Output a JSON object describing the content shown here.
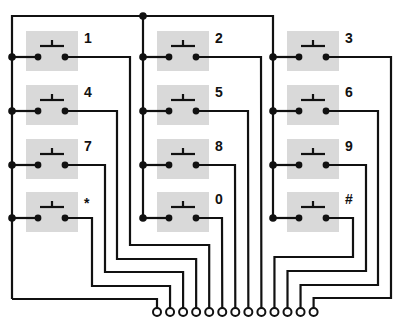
{
  "diagram": {
    "colors": {
      "wire": "#111111",
      "switch_box": "#d9d9d9",
      "background": "#ffffff"
    },
    "keys": [
      {
        "label": "1",
        "col": 0,
        "row": 0,
        "terminal": 4
      },
      {
        "label": "2",
        "col": 1,
        "row": 0,
        "terminal": 8
      },
      {
        "label": "3",
        "col": 2,
        "row": 0,
        "terminal": 12
      },
      {
        "label": "4",
        "col": 0,
        "row": 1,
        "terminal": 3
      },
      {
        "label": "5",
        "col": 1,
        "row": 1,
        "terminal": 7
      },
      {
        "label": "6",
        "col": 2,
        "row": 1,
        "terminal": 11
      },
      {
        "label": "7",
        "col": 0,
        "row": 2,
        "terminal": 2
      },
      {
        "label": "8",
        "col": 1,
        "row": 2,
        "terminal": 6
      },
      {
        "label": "9",
        "col": 2,
        "row": 2,
        "terminal": 10
      },
      {
        "label": "*",
        "col": 0,
        "row": 3,
        "terminal": 1
      },
      {
        "label": "0",
        "col": 1,
        "row": 3,
        "terminal": 5
      },
      {
        "label": "#",
        "col": 2,
        "row": 3,
        "terminal": 9
      }
    ],
    "terminal_count": 13,
    "common_terminal": 0
  }
}
